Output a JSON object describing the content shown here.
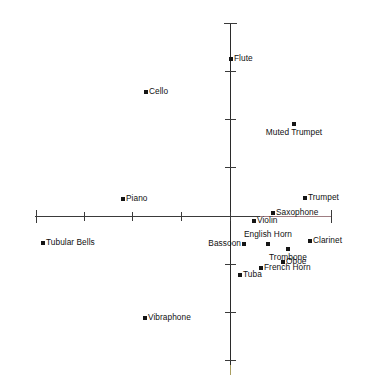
{
  "chart_data": {
    "type": "scatter",
    "title": "",
    "subtitle": "",
    "xlabel": "",
    "ylabel": "",
    "grid": false,
    "legend": false,
    "axes": {
      "origin_px": {
        "x": 230,
        "y": 216
      },
      "x_axis_px": {
        "start": 35,
        "end": 331,
        "y": 216
      },
      "y_axis_px": {
        "top": 23,
        "bottom": 375,
        "x": 230
      },
      "x_tick_spacing_px": 48,
      "y_tick_spacing_px": 48,
      "x_ticks_px": [
        36,
        84,
        132,
        181,
        230,
        331
      ],
      "y_ticks_px": [
        23,
        71,
        119,
        167,
        264,
        312,
        360
      ],
      "xlim": [
        -4.05,
        2.1
      ],
      "ylim": [
        -3.3,
        4.0
      ]
    },
    "axis_colors": {
      "x_axis": "#3a3a3a",
      "x_axis_right_tint": "#b08a8f",
      "y_axis": "#2b2b2b",
      "y_axis_bottom_tint": "#c9bb6e",
      "marker": "#151515",
      "label": "#101010"
    },
    "points": [
      {
        "label": "Flute",
        "x": 0.02,
        "y": 3.26,
        "px": 231,
        "py": 59,
        "label_side": "right"
      },
      {
        "label": "Cello",
        "x": -1.75,
        "y": 2.56,
        "px": 146,
        "py": 92,
        "label_side": "right"
      },
      {
        "label": "Muted Trumpet",
        "x": 1.33,
        "y": 1.9,
        "px": 294,
        "py": 124,
        "label_side": "below-center"
      },
      {
        "label": "Trumpet",
        "x": 1.56,
        "y": 0.37,
        "px": 305,
        "py": 198,
        "label_side": "right"
      },
      {
        "label": "Piano",
        "x": -2.23,
        "y": 0.35,
        "px": 123,
        "py": 199,
        "label_side": "right"
      },
      {
        "label": "Saxophone",
        "x": 0.9,
        "y": 0.06,
        "px": 273,
        "py": 213,
        "label_side": "right"
      },
      {
        "label": "Violin",
        "x": 0.5,
        "y": -0.1,
        "px": 254,
        "py": 221,
        "label_side": "right"
      },
      {
        "label": "Tubular Bells",
        "x": -3.9,
        "y": -0.56,
        "px": 43,
        "py": 243,
        "label_side": "right"
      },
      {
        "label": "Clarinet",
        "x": 1.67,
        "y": -0.52,
        "px": 310,
        "py": 241,
        "label_side": "right"
      },
      {
        "label": "English Horn",
        "x": 0.79,
        "y": -0.58,
        "px": 268,
        "py": 244,
        "label_side": "above-center"
      },
      {
        "label": "Bassoon",
        "x": 0.29,
        "y": -0.58,
        "px": 244,
        "py": 244,
        "label_side": "left"
      },
      {
        "label": "Trombone",
        "x": 1.21,
        "y": -0.69,
        "px": 288,
        "py": 249,
        "label_side": "below-center"
      },
      {
        "label": "Oboe",
        "x": 1.1,
        "y": -0.94,
        "px": 283,
        "py": 262,
        "label_side": "right"
      },
      {
        "label": "French Horn",
        "x": 0.65,
        "y": -1.06,
        "px": 261,
        "py": 268,
        "label_side": "right"
      },
      {
        "label": "Tuba",
        "x": 0.21,
        "y": -1.21,
        "px": 240,
        "py": 275,
        "label_side": "right"
      },
      {
        "label": "Vibraphone",
        "x": -1.77,
        "y": -2.13,
        "px": 145,
        "py": 318,
        "label_side": "right"
      }
    ]
  }
}
